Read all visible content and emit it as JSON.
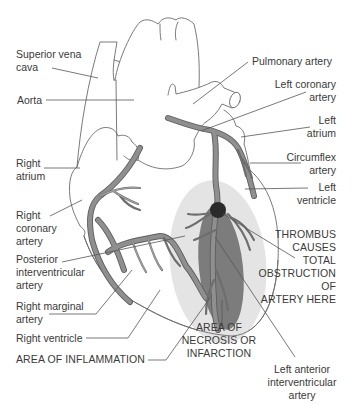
{
  "diagram": {
    "colors": {
      "outline": "#6b6b6b",
      "artery": "#8f8f8f",
      "artery_edge": "#5e5e5e",
      "inflammation": "#e4e4e4",
      "necrosis": "#7c7c7c",
      "thrombus": "#2a2a2a",
      "leader": "#555555",
      "text": "#3a3a3a"
    },
    "labels_left": [
      {
        "id": "superior-vena-cava",
        "text": "Superior vena\ncava"
      },
      {
        "id": "aorta",
        "text": "Aorta"
      },
      {
        "id": "right-atrium",
        "text": "Right\natrium"
      },
      {
        "id": "right-coronary-artery",
        "text": "Right\ncoronary\nartery"
      },
      {
        "id": "posterior-interventricular-artery",
        "text": "Posterior\ninterventricular\nartery"
      },
      {
        "id": "right-marginal-artery",
        "text": "Right marginal\nartery"
      },
      {
        "id": "right-ventricle",
        "text": "Right ventricle"
      },
      {
        "id": "area-of-inflammation",
        "text": "AREA OF INFLAMMATION"
      }
    ],
    "labels_right": [
      {
        "id": "pulmonary-artery",
        "text": "Pulmonary artery"
      },
      {
        "id": "left-coronary-artery",
        "text": "Left coronary\nartery"
      },
      {
        "id": "left-atrium",
        "text": "Left\natrium"
      },
      {
        "id": "circumflex-artery",
        "text": "Circumflex\nartery"
      },
      {
        "id": "left-ventricle",
        "text": "Left\nventricle"
      },
      {
        "id": "thrombus-note",
        "text": "THROMBUS\nCAUSES\nTOTAL\nOBSTRUCTION\nOF\nARTERY HERE"
      }
    ],
    "labels_bottom": [
      {
        "id": "area-of-necrosis",
        "text": "AREA OF\nNECROSIS OR\nINFARCTION"
      },
      {
        "id": "left-anterior-interventricular-artery",
        "text": "Left anterior\ninterventricular\nartery"
      }
    ]
  }
}
